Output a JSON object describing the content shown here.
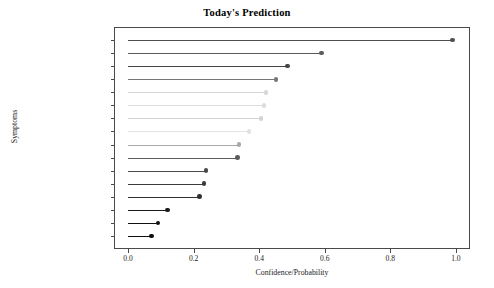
{
  "chart_data": {
    "type": "bar",
    "subtype": "lollipop-horizontal",
    "title": "Today's Prediction",
    "xlabel": "Confidence/Probability",
    "ylabel": "Symptoms",
    "xlim": [
      -0.043,
      1.043
    ],
    "xticks": [
      "0.0",
      "0.2",
      "0.4",
      "0.6",
      "0.8",
      "1.0"
    ],
    "xtick_values": [
      0.0,
      0.2,
      0.4,
      0.6,
      0.8,
      1.0
    ],
    "grid": false,
    "legend": null,
    "categories": [
      "Lack of emotion",
      "Lack of concentration",
      "Fatigue",
      "Mood swings",
      "Stress",
      "Decrease in agility",
      "Sense of guilt",
      "Social awkwardness",
      "Lack of weight",
      "Excess of emotion",
      "Overthinking",
      "Lack of sleep",
      "Excess of weight",
      "Excess of sleep",
      "Worthlessness",
      "Suicidal thoughts"
    ],
    "values": [
      0.99,
      0.59,
      0.486,
      0.451,
      0.421,
      0.414,
      0.405,
      0.369,
      0.338,
      0.334,
      0.238,
      0.231,
      0.217,
      0.12,
      0.091,
      0.072
    ],
    "colors": [
      "#4f4f4f",
      "#5a5a5a",
      "#444444",
      "#777777",
      "#d6d6d6",
      "#dcdcdc",
      "#d2d2d2",
      "#e2e2e2",
      "#a8a8a8",
      "#5c5c5c",
      "#4a4a4a",
      "#3b3b3b",
      "#303030",
      "#1a1a1a",
      "#111111",
      "#0d0d0d"
    ],
    "axis_color": "#4a4a4a",
    "background": "#ffffff"
  }
}
